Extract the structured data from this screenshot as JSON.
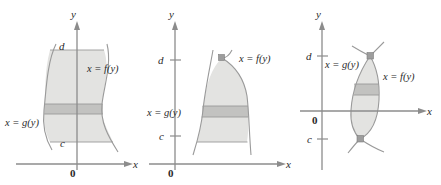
{
  "figure": {
    "colors": {
      "region_fill": "#e3e3e1",
      "strip_fill": "#c2c2c0",
      "curve_stroke": "#9a9a9a",
      "axis_stroke": "#8c8c8c",
      "text": "#2a2a2a",
      "dot": "#9d9d9d",
      "background": "#ffffff"
    },
    "panels": [
      {
        "id": "panel-1",
        "name": "curves-do-not-intersect",
        "axis_x_label": "x",
        "axis_y_label": "y",
        "origin_label": "0",
        "upper_bound_label": "d",
        "lower_bound_label": "c",
        "right_curve_label": "x = f(y)",
        "left_curve_label": "x = g(y)",
        "has_intersection_dots": false,
        "y_axis_ticks": []
      },
      {
        "id": "panel-2",
        "name": "curves-meet-at-top",
        "axis_x_label": "x",
        "axis_y_label": "y",
        "origin_label": "0",
        "upper_bound_label": "d",
        "lower_bound_label": "c",
        "right_curve_label": "x = f(y)",
        "left_curve_label": "x = g(y)",
        "has_intersection_dots": true,
        "y_axis_ticks": [
          "d",
          "c"
        ]
      },
      {
        "id": "panel-3",
        "name": "curves-meet-at-both-ends",
        "axis_x_label": "x",
        "axis_y_label": "y",
        "origin_label": "0",
        "upper_bound_label": "d",
        "lower_bound_label": "c",
        "right_curve_label": "x = f(y)",
        "left_curve_label": "x = g(y)",
        "has_intersection_dots": true,
        "y_axis_ticks": [
          "d",
          "c"
        ]
      }
    ]
  }
}
